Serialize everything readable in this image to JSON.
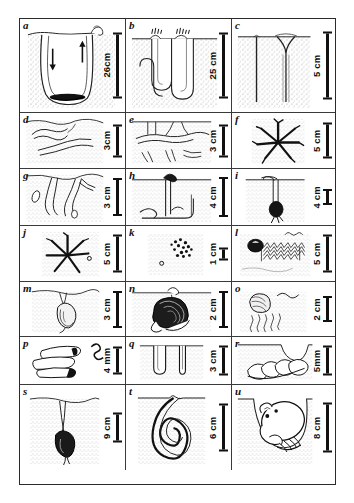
{
  "figure": {
    "title": "",
    "columns": 3,
    "rows": 7,
    "panel_count": 21,
    "ink_color": "#1a1a1a",
    "sediment_color": "#8d8d8d",
    "background_color": "#ffffff"
  },
  "panels": [
    {
      "id": "a",
      "label": "a",
      "scale": "26cm",
      "scale_value": 26,
      "scale_unit": "cm",
      "subject": "deep U-shaped burrow with water-flow arrows and lined base",
      "icon": "u-burrow-with-flow-arrows"
    },
    {
      "id": "b",
      "label": "b",
      "scale": "25 cm",
      "scale_value": 25,
      "scale_unit": "cm",
      "subject": "double U-shaped burrows with funnel openings at surface",
      "icon": "double-u-burrow"
    },
    {
      "id": "c",
      "label": "c",
      "scale": "5 cm",
      "scale_value": 5,
      "scale_unit": "cm",
      "subject": "two vertical shafts, one with funnel-shaped opening",
      "icon": "vertical-shaft-burrow"
    },
    {
      "id": "d",
      "label": "d",
      "scale": "3cm",
      "scale_value": 3,
      "scale_unit": "cm",
      "subject": "shallow horizontal meandering burrows near surface",
      "icon": "horizontal-meander-burrow"
    },
    {
      "id": "e",
      "label": "e",
      "scale": "3 cm",
      "scale_value": 3,
      "scale_unit": "cm",
      "subject": "branching shallow burrow network with fragments",
      "icon": "branching-shallow-burrow"
    },
    {
      "id": "f",
      "label": "f",
      "scale": "5 cm",
      "scale_value": 5,
      "scale_unit": "cm",
      "subject": "star-shaped radiating feeding trace",
      "icon": "star-radiating-trace"
    },
    {
      "id": "g",
      "label": "g",
      "scale": "3 cm",
      "scale_value": 3,
      "scale_unit": "cm",
      "subject": "branching dendritic burrow descending from surface",
      "icon": "dendritic-branching-burrow"
    },
    {
      "id": "h",
      "label": "h",
      "scale": "4 cm",
      "scale_value": 4,
      "scale_unit": "cm",
      "subject": "vertical shaft with surface mound and deep L-shaped galleries",
      "icon": "shaft-with-mound-burrow"
    },
    {
      "id": "i",
      "label": "i",
      "scale": "4 cm",
      "scale_value": 4,
      "scale_unit": "cm",
      "subject": "J-shaped burrow with dark organism at base",
      "icon": "j-burrow-with-organism"
    },
    {
      "id": "j",
      "label": "j",
      "scale": "5 cm",
      "scale_value": 5,
      "scale_unit": "cm",
      "subject": "star-shaped radiating trace with small pellet",
      "icon": "star-radiating-trace-small"
    },
    {
      "id": "k",
      "label": "k",
      "scale": "1 cm",
      "scale_value": 1,
      "scale_unit": "cm",
      "subject": "scattered faecal pellet cluster on sediment surface",
      "icon": "pellet-cluster"
    },
    {
      "id": "l",
      "label": "l",
      "scale": "5 cm",
      "scale_value": 5,
      "scale_unit": "cm",
      "subject": "bivalve with long herringbone crawling trail and surface ripple",
      "icon": "bivalve-with-trail"
    },
    {
      "id": "m",
      "label": "m",
      "scale": "3 cm",
      "scale_value": 3,
      "scale_unit": "cm",
      "subject": "buried gastropod suspended below surface opening",
      "icon": "buried-gastropod"
    },
    {
      "id": "n",
      "label": "n",
      "scale": "2 cm",
      "scale_value": 2,
      "scale_unit": "cm",
      "subject": "large gastropod in sediment with siphon to surface",
      "icon": "gastropod-with-siphon"
    },
    {
      "id": "o",
      "label": "o",
      "scale": "2 cm",
      "scale_value": 2,
      "scale_unit": "cm",
      "subject": "bivalve with wavy plough trails and surface ripple mark",
      "icon": "bivalve-plough-trails"
    },
    {
      "id": "p",
      "label": "p",
      "scale": "4 mm",
      "scale_value": 4,
      "scale_unit": "mm",
      "subject": "agglutinated tube casings and small coiled worm",
      "icon": "worm-tubes"
    },
    {
      "id": "q",
      "label": "q",
      "scale": "3 cm",
      "scale_value": 3,
      "scale_unit": "cm",
      "subject": "two simple vertical tube burrows, one U-shaped",
      "icon": "vertical-tube-burrows"
    },
    {
      "id": "r",
      "label": "r",
      "scale": "5mm",
      "scale_value": 5,
      "scale_unit": "mm",
      "subject": "gastropod shell resting at base of surface depression",
      "icon": "shell-in-depression"
    },
    {
      "id": "s",
      "label": "s",
      "scale": "9 cm",
      "scale_value": 9,
      "scale_unit": "cm",
      "subject": "deep narrow shaft with dark bulbous organism at depth",
      "icon": "deep-shaft-with-organism"
    },
    {
      "id": "t",
      "label": "t",
      "scale": "6 cm",
      "scale_value": 6,
      "scale_unit": "cm",
      "subject": "spiral coiled burrow descending from surface opening",
      "icon": "spiral-coiled-burrow"
    },
    {
      "id": "u",
      "label": "u",
      "scale": "8 cm",
      "scale_value": 8,
      "scale_unit": "cm",
      "subject": "crab occupying a broad rounded chamber burrow",
      "icon": "crab-in-chamber"
    }
  ]
}
